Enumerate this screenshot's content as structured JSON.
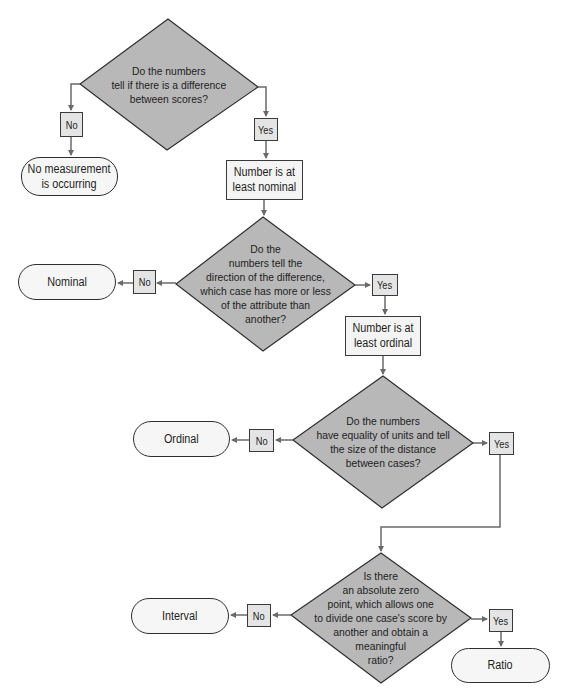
{
  "flowchart": {
    "colors": {
      "decision_fill": "#b8b8b8",
      "label_fill": "#e4e4e4",
      "box_fill": "#f4f4f4",
      "terminal_fill": "#f6f6f6",
      "line": "#6a6a6a",
      "stroke": "#3a3a3a"
    },
    "decisions": [
      {
        "id": "d1",
        "text": "Do the numbers\ntell if there is a difference\nbetween scores?"
      },
      {
        "id": "d2",
        "text": "Do the\nnumbers tell the\ndirection of the difference,\nwhich case has more or less\nof the attribute than\nanother?"
      },
      {
        "id": "d3",
        "text": "Do the numbers\nhave equality of units and tell\nthe size of the distance\nbetween cases?"
      },
      {
        "id": "d4",
        "text": "Is there\nan absolute zero\npoint, which allows one\nto divide one case's score by\nanother and obtain a\nmeaningful\nratio?"
      }
    ],
    "process_boxes": [
      {
        "id": "p1",
        "text": "Number is at\nleast nominal"
      },
      {
        "id": "p2",
        "text": "Number is at\nleast ordinal"
      }
    ],
    "terminals": [
      {
        "id": "t0",
        "text": "No measurement\nis occurring"
      },
      {
        "id": "t1",
        "text": "Nominal"
      },
      {
        "id": "t2",
        "text": "Ordinal"
      },
      {
        "id": "t3",
        "text": "Interval"
      },
      {
        "id": "t4",
        "text": "Ratio"
      }
    ],
    "branch_labels": {
      "no": "No",
      "yes": "Yes"
    }
  }
}
